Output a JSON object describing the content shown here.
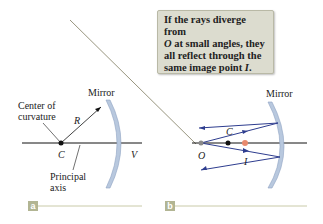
{
  "panel_a": {
    "label": "a",
    "mirror_label": "Mirror",
    "center_label_line1": "Center of",
    "center_label_line2": "curvature",
    "radius_label": "R",
    "c_label": "C",
    "v_label": "V",
    "axis_label_line1": "Principal",
    "axis_label_line2": "axis"
  },
  "panel_b": {
    "label": "b",
    "mirror_label": "Mirror",
    "c_label": "C",
    "o_label": "O",
    "i_label": "I",
    "callout": {
      "line1": "If the rays diverge from",
      "line2_italic": "O",
      "line2_rest": " at small angles, they",
      "line3": "all reflect through the",
      "line4_text": "same image point ",
      "line4_italic": "I",
      "line4_end": "."
    }
  },
  "colors": {
    "ray": "#2e3d8f",
    "mirror": "#b8c8de",
    "image_point": "#e88a6e",
    "object_point": "#8a8a8a",
    "tag": "#b2b593",
    "callout_bg": "#dcdccf"
  }
}
